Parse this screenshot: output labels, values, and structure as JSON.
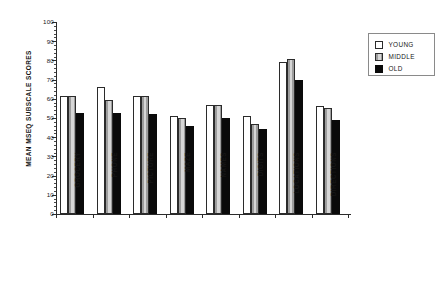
{
  "chart_data": {
    "type": "bar",
    "title": "",
    "xlabel": "",
    "ylabel": "MEAN MSEQ SUBSCALE SCORES",
    "ylim": [
      0,
      100
    ],
    "ytick_step": 10,
    "yticks": [
      0,
      10,
      20,
      30,
      40,
      50,
      60,
      70,
      80,
      90,
      100
    ],
    "ytick_labels": [
      "0",
      "10",
      "20",
      "30",
      "40",
      "50",
      "60",
      "70",
      "80",
      "90",
      "100"
    ],
    "grid": false,
    "legend_position": "top-right",
    "categories": [
      "GROCERY",
      "PHONE",
      "PICTURE",
      "MAZE",
      "NAMES",
      "DIGITS",
      "LOCATIONS",
      "DIRECTIONS"
    ],
    "series": [
      {
        "name": "YOUNG",
        "color": "#ffffff",
        "values": [
          61.5,
          66.0,
          61.5,
          51.0,
          57.0,
          51.0,
          79.0,
          56.0
        ]
      },
      {
        "name": "MIDDLE",
        "color": "#c0c0c0",
        "values": [
          61.5,
          59.5,
          61.5,
          50.0,
          57.0,
          47.0,
          80.5,
          55.0
        ]
      },
      {
        "name": "OLD",
        "color": "#0a0a0a",
        "values": [
          52.5,
          52.5,
          52.0,
          46.0,
          50.0,
          44.5,
          70.0,
          49.0
        ]
      }
    ]
  },
  "legend": {
    "items": [
      {
        "label": "YOUNG",
        "swatch": "young"
      },
      {
        "label": "MIDDLE",
        "swatch": "middle"
      },
      {
        "label": "OLD",
        "swatch": "old"
      }
    ]
  }
}
